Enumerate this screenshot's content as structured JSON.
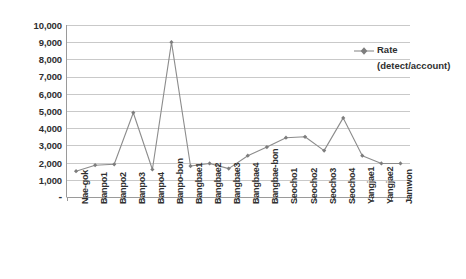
{
  "chart_data": {
    "type": "line",
    "title": "",
    "xlabel": "",
    "ylabel": "",
    "ylim": [
      0,
      10000
    ],
    "ytick_labels": [
      "10,000",
      "9,000",
      "8,000",
      "7,000",
      "6,000",
      "5,000",
      "4,000",
      "3,000",
      "2,000",
      "1,000",
      "-"
    ],
    "ytick_values": [
      10000,
      9000,
      8000,
      7000,
      6000,
      5000,
      4000,
      3000,
      2000,
      1000,
      0
    ],
    "grid": true,
    "legend_position": "right",
    "legend": [
      "Rate (detect/account)"
    ],
    "marker": "diamond",
    "series_color": "#8c8c8c",
    "categories": [
      "Nae-gok",
      "Banpo1",
      "Banpo2",
      "Banpo3",
      "Banpo4",
      "Banpo-bon",
      "Bangbae1",
      "Bangbae2",
      "Bangbae3",
      "Bangbae4",
      "Bangbae-bon",
      "Seocho1",
      "Seocho2",
      "Seocho3",
      "Seocho4",
      "Yangjae1",
      "Yangjae2",
      "Jamwon"
    ],
    "series": [
      {
        "name": "Rate (detect/account)",
        "values": [
          1500,
          1850,
          1900,
          4900,
          1600,
          9000,
          1800,
          1950,
          1650,
          2400,
          2900,
          3450,
          3500,
          2700,
          4600,
          2400,
          1950,
          1950
        ]
      }
    ]
  },
  "legend": {
    "line1": "Rate",
    "line2": "(detect/account)",
    "marker_name": "line-marker-diamond"
  }
}
